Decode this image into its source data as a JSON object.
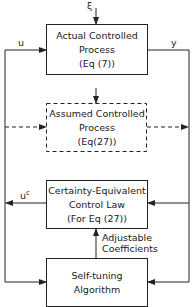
{
  "blocks": {
    "actual_process": {
      "line1": "Actual Controlled",
      "line2": "Process",
      "line3": "(Eq (7))"
    },
    "assumed_process": {
      "line1": "Assumed Controlled",
      "line2": "Process",
      "line3": "(Eq(27))"
    },
    "control_law": {
      "line1": "Certainty-Equivalent",
      "line2": "Control Law",
      "line3": "(For Eq (27))"
    },
    "self_tuning": {
      "line1": "Self-tuning",
      "line2": "Algorithm"
    }
  },
  "signals": {
    "disturbance": "ξ",
    "input": "u",
    "output": "y",
    "control_base": "u",
    "control_sup": "c",
    "coeff_line1": "Adjustable",
    "coeff_line2": "Coefficients"
  },
  "colors": {
    "line": "#222222",
    "background": "#ffffff"
  }
}
